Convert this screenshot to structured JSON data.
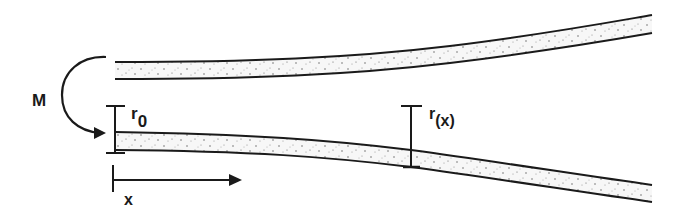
{
  "diagram": {
    "type": "flared-tube-schematic",
    "colors": {
      "stroke": "#1a1a1a",
      "fill": "#f7f7f7",
      "speckle": "#555555",
      "background": "#ffffff"
    },
    "labels": {
      "moment": "M",
      "initial_radius": "r",
      "initial_radius_sub": "0",
      "local_radius": "r",
      "local_radius_sub": "(x)",
      "axis": "x"
    },
    "elements": [
      {
        "name": "upper-tube-wall",
        "x_start": 115,
        "x_end": 652
      },
      {
        "name": "lower-tube-wall",
        "x_start": 115,
        "x_end": 652
      },
      {
        "name": "moment-arrow",
        "label": "M"
      },
      {
        "name": "r0-dimension",
        "label": "r0",
        "x": 115
      },
      {
        "name": "rx-dimension",
        "label": "r(x)",
        "x": 411
      },
      {
        "name": "x-axis-arrow",
        "label": "x"
      }
    ]
  }
}
